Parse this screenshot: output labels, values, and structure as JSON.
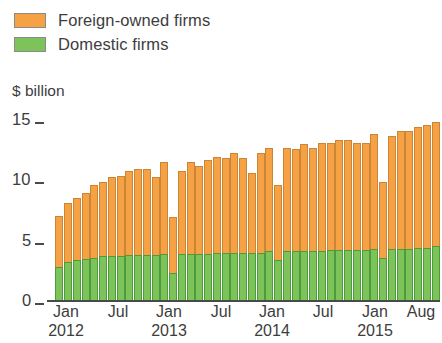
{
  "legend": {
    "items": [
      {
        "label": "Foreign-owned firms",
        "color": "#f5a144",
        "name": "legend-foreign-owned-firms"
      },
      {
        "label": "Domestic firms",
        "color": "#7cc45a",
        "name": "legend-domestic-firms"
      }
    ]
  },
  "axis_title": "$ billion",
  "y_ticks": [
    "15",
    "10",
    "5",
    "0"
  ],
  "x_ticks": [
    {
      "month": "Jan",
      "year": "2012"
    },
    {
      "month": "Jul",
      "year": ""
    },
    {
      "month": "Jan",
      "year": "2013"
    },
    {
      "month": "Jul",
      "year": ""
    },
    {
      "month": "Jan",
      "year": "2014"
    },
    {
      "month": "Jul",
      "year": ""
    },
    {
      "month": "Jan",
      "year": "2015"
    },
    {
      "month": "Aug",
      "year": ""
    }
  ],
  "colors": {
    "foreign": "#f5a144",
    "domestic": "#7cc45a",
    "foreign_edge": "#c98636",
    "domestic_edge": "#4d9b3c",
    "axis": "#4a4a4a",
    "text": "#3d3d3d"
  },
  "chart_data": {
    "type": "bar",
    "subtype": "stacked-column",
    "title": "",
    "xlabel": "",
    "ylabel": "$ billion",
    "ylim": [
      0,
      15
    ],
    "y_ticks": [
      0,
      5,
      10,
      15
    ],
    "grid": false,
    "legend_position": "top-left",
    "unit": "$ billion",
    "categories": [
      "Jan 2012",
      "Feb 2012",
      "Mar 2012",
      "Apr 2012",
      "May 2012",
      "Jun 2012",
      "Jul 2012",
      "Aug 2012",
      "Sep 2012",
      "Oct 2012",
      "Nov 2012",
      "Dec 2012",
      "Jan 2013",
      "Feb 2013",
      "Mar 2013",
      "Apr 2013",
      "May 2013",
      "Jun 2013",
      "Jul 2013",
      "Aug 2013",
      "Sep 2013",
      "Oct 2013",
      "Nov 2013",
      "Dec 2013",
      "Jan 2014",
      "Feb 2014",
      "Mar 2014",
      "Apr 2014",
      "May 2014",
      "Jun 2014",
      "Jul 2014",
      "Aug 2014",
      "Sep 2014",
      "Oct 2014",
      "Nov 2014",
      "Dec 2014",
      "Jan 2015",
      "Feb 2015",
      "Mar 2015",
      "Apr 2015",
      "May 2015",
      "Jun 2015",
      "Jul 2015",
      "Aug 2015"
    ],
    "series": [
      {
        "name": "Domestic firms",
        "color": "#7cc45a",
        "values": [
          2.6,
          3.0,
          3.1,
          3.2,
          3.3,
          3.4,
          3.4,
          3.4,
          3.5,
          3.5,
          3.5,
          3.5,
          3.6,
          2.1,
          3.6,
          3.6,
          3.6,
          3.6,
          3.7,
          3.7,
          3.7,
          3.7,
          3.7,
          3.7,
          3.8,
          3.1,
          3.8,
          3.8,
          3.8,
          3.8,
          3.8,
          3.9,
          3.9,
          3.9,
          3.9,
          3.9,
          4.0,
          3.3,
          4.0,
          4.0,
          4.0,
          4.1,
          4.1,
          4.2
        ]
      },
      {
        "name": "Foreign-owned firms",
        "color": "#f5a144",
        "values": [
          4.0,
          4.6,
          4.9,
          5.2,
          5.7,
          5.8,
          6.2,
          6.3,
          6.6,
          6.7,
          6.7,
          6.1,
          7.2,
          4.4,
          6.5,
          7.2,
          6.9,
          7.3,
          7.5,
          7.4,
          7.8,
          7.4,
          6.2,
          7.8,
          8.1,
          5.9,
          8.1,
          8.0,
          8.4,
          8.1,
          8.5,
          8.4,
          8.6,
          8.6,
          8.4,
          8.4,
          9.0,
          5.9,
          8.8,
          9.2,
          9.2,
          9.4,
          9.6,
          9.7
        ]
      }
    ],
    "totals": [
      6.6,
      7.6,
      8.0,
      8.4,
      9.0,
      9.2,
      9.6,
      9.7,
      10.1,
      10.2,
      10.2,
      9.6,
      10.8,
      6.5,
      10.1,
      10.8,
      10.5,
      10.9,
      11.2,
      11.1,
      11.5,
      11.1,
      9.9,
      11.5,
      11.9,
      9.0,
      11.9,
      11.8,
      12.2,
      11.9,
      12.3,
      12.3,
      12.5,
      12.5,
      12.3,
      12.3,
      13.0,
      9.2,
      12.8,
      13.2,
      13.2,
      13.5,
      13.7,
      13.9
    ]
  }
}
